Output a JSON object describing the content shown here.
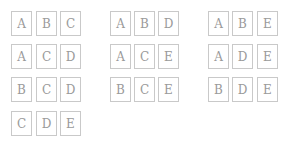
{
  "groups": [
    {
      "rows": [
        [
          "A",
          "B",
          "C"
        ],
        [
          "A",
          "C",
          "D"
        ],
        [
          "B",
          "C",
          "D"
        ],
        [
          "C",
          "D",
          "E"
        ]
      ]
    },
    {
      "rows": [
        [
          "A",
          "B",
          "D"
        ],
        [
          "A",
          "C",
          "E"
        ],
        [
          "B",
          "C",
          "E"
        ]
      ]
    },
    {
      "rows": [
        [
          "A",
          "B",
          "E"
        ],
        [
          "A",
          "D",
          "E"
        ],
        [
          "B",
          "D",
          "E"
        ]
      ]
    }
  ]
}
